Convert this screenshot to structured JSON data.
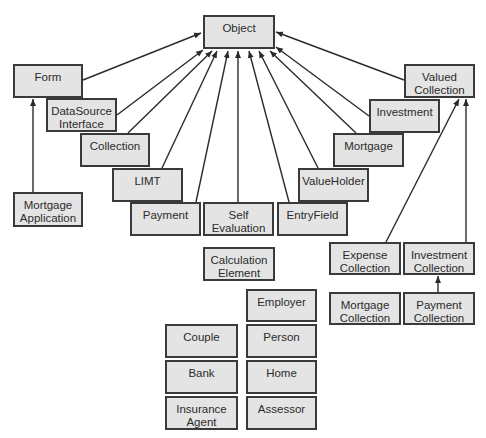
{
  "diagram": {
    "type": "class-inheritance-diagram",
    "colors": {
      "box_fill": "#e4e4e4",
      "box_border": "#3a3a3a",
      "edge": "#2b2b2b",
      "text": "#2b2b2b",
      "background": "#ffffff"
    },
    "nodes": [
      {
        "id": "object",
        "label": "Object",
        "x": 203,
        "y": 15,
        "w": 72,
        "h": 34
      },
      {
        "id": "form",
        "label": "Form",
        "x": 13,
        "y": 64,
        "w": 70,
        "h": 34
      },
      {
        "id": "datasource-interface",
        "label": "DataSource\nInterface",
        "x": 46,
        "y": 98,
        "w": 71,
        "h": 34
      },
      {
        "id": "collection",
        "label": "Collection",
        "x": 80,
        "y": 133,
        "w": 70,
        "h": 34
      },
      {
        "id": "limt",
        "label": "LIMT",
        "x": 112,
        "y": 168,
        "w": 71,
        "h": 34
      },
      {
        "id": "payment",
        "label": "Payment",
        "x": 130,
        "y": 202,
        "w": 71,
        "h": 34
      },
      {
        "id": "self-evaluation",
        "label": "Self\nEvaluation",
        "x": 203,
        "y": 202,
        "w": 71,
        "h": 34
      },
      {
        "id": "entryfield",
        "label": "EntryField",
        "x": 277,
        "y": 202,
        "w": 71,
        "h": 34
      },
      {
        "id": "valueholder",
        "label": "ValueHolder",
        "x": 298,
        "y": 168,
        "w": 71,
        "h": 34
      },
      {
        "id": "mortgage",
        "label": "Mortgage",
        "x": 333,
        "y": 133,
        "w": 71,
        "h": 34
      },
      {
        "id": "investment",
        "label": "Investment",
        "x": 369,
        "y": 99,
        "w": 71,
        "h": 34
      },
      {
        "id": "valued-collection",
        "label": "Valued\nCollection",
        "x": 404,
        "y": 64,
        "w": 71,
        "h": 34
      },
      {
        "id": "mortgage-application",
        "label": "Mortgage\nApplication",
        "x": 13,
        "y": 192,
        "w": 70,
        "h": 35
      },
      {
        "id": "calculation-element",
        "label": "Calculation\nElement",
        "x": 203,
        "y": 247,
        "w": 72,
        "h": 34
      },
      {
        "id": "expense-collection",
        "label": "Expense\nCollection",
        "x": 329,
        "y": 242,
        "w": 72,
        "h": 33
      },
      {
        "id": "investment-collection",
        "label": "Investment\nCollection",
        "x": 403,
        "y": 242,
        "w": 72,
        "h": 33
      },
      {
        "id": "mortgage-collection",
        "label": "Mortgage\nCollection",
        "x": 329,
        "y": 292,
        "w": 72,
        "h": 33
      },
      {
        "id": "payment-collection",
        "label": "Payment\nCollection",
        "x": 403,
        "y": 292,
        "w": 72,
        "h": 33
      },
      {
        "id": "employer",
        "label": "Employer",
        "x": 246,
        "y": 289,
        "w": 71,
        "h": 33
      },
      {
        "id": "couple",
        "label": "Couple",
        "x": 165,
        "y": 324,
        "w": 73,
        "h": 34
      },
      {
        "id": "person",
        "label": "Person",
        "x": 246,
        "y": 324,
        "w": 71,
        "h": 34
      },
      {
        "id": "bank",
        "label": "Bank",
        "x": 165,
        "y": 360,
        "w": 73,
        "h": 34
      },
      {
        "id": "home",
        "label": "Home",
        "x": 246,
        "y": 360,
        "w": 71,
        "h": 34
      },
      {
        "id": "insurance-agent",
        "label": "Insurance\nAgent",
        "x": 165,
        "y": 396,
        "w": 73,
        "h": 34
      },
      {
        "id": "assessor",
        "label": "Assessor",
        "x": 246,
        "y": 396,
        "w": 71,
        "h": 34
      }
    ],
    "edges": [
      {
        "from": "form",
        "to": "object",
        "x1": 83,
        "y1": 80,
        "x2": 201,
        "y2": 33
      },
      {
        "from": "datasource-interface",
        "to": "object",
        "x1": 117,
        "y1": 115,
        "x2": 203,
        "y2": 50
      },
      {
        "from": "collection",
        "to": "object",
        "x1": 128,
        "y1": 133,
        "x2": 212,
        "y2": 51
      },
      {
        "from": "limt",
        "to": "object",
        "x1": 162,
        "y1": 168,
        "x2": 217,
        "y2": 51
      },
      {
        "from": "payment",
        "to": "object",
        "x1": 196,
        "y1": 202,
        "x2": 228,
        "y2": 51
      },
      {
        "from": "self-evaluation",
        "to": "object",
        "x1": 238,
        "y1": 202,
        "x2": 238,
        "y2": 51
      },
      {
        "from": "entryfield",
        "to": "object",
        "x1": 289,
        "y1": 202,
        "x2": 249,
        "y2": 51
      },
      {
        "from": "valueholder",
        "to": "object",
        "x1": 318,
        "y1": 168,
        "x2": 259,
        "y2": 51
      },
      {
        "from": "mortgage",
        "to": "object",
        "x1": 356,
        "y1": 133,
        "x2": 270,
        "y2": 51
      },
      {
        "from": "investment",
        "to": "object",
        "x1": 369,
        "y1": 116,
        "x2": 276,
        "y2": 47
      },
      {
        "from": "valued-collection",
        "to": "object",
        "x1": 404,
        "y1": 80,
        "x2": 276,
        "y2": 32
      },
      {
        "from": "mortgage-application",
        "to": "form",
        "x1": 33,
        "y1": 192,
        "x2": 33,
        "y2": 99
      },
      {
        "from": "expense-collection",
        "to": "valued-collection",
        "x1": 386,
        "y1": 242,
        "x2": 459,
        "y2": 99
      },
      {
        "from": "investment-collection",
        "to": "valued-collection",
        "x1": 466,
        "y1": 242,
        "x2": 466,
        "y2": 99
      },
      {
        "from": "payment-collection",
        "to": "investment-collection",
        "x1": 438,
        "y1": 292,
        "x2": 438,
        "y2": 276
      }
    ]
  }
}
